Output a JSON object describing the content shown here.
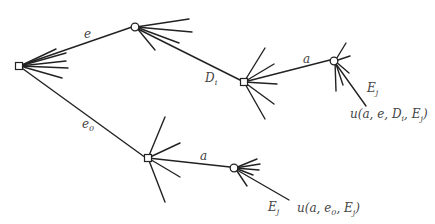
{
  "diagram": {
    "title": "",
    "type": "decision-tree",
    "node_kinds": {
      "decision": "square-node",
      "chance": "circle-node"
    },
    "labels": {
      "edge_e": {
        "base": "e",
        "sub": ""
      },
      "edge_e0": {
        "base": "e",
        "sub": "0"
      },
      "edge_Di": {
        "base": "D",
        "sub": "i"
      },
      "edge_a_upper": {
        "base": "a",
        "sub": ""
      },
      "edge_a_lower": {
        "base": "a",
        "sub": ""
      },
      "edge_Ej_upper": {
        "base": "E",
        "sub": "j"
      },
      "edge_Ej_lower": {
        "base": "E",
        "sub": "j"
      },
      "payoff_upper": "u(a, e, Dᵢ, Eⱼ)",
      "payoff_lower": "u(a, e₀, Eⱼ)"
    },
    "payoff_upper_parts": [
      "u(a, e, D",
      "i",
      ", E",
      "j",
      ")"
    ],
    "payoff_lower_parts": [
      "u(a, e",
      "0",
      ", E",
      "j",
      ")"
    ],
    "colors": {
      "line": "#222222",
      "label": "#444444",
      "background": "#ffffff"
    }
  }
}
